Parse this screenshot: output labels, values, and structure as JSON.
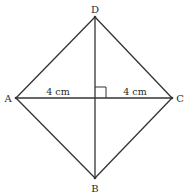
{
  "diagram": {
    "type": "rhombus-with-diagonals",
    "vertices": {
      "A": {
        "label": "A",
        "x": 16,
        "y": 98
      },
      "B": {
        "label": "B",
        "x": 95,
        "y": 178
      },
      "C": {
        "label": "C",
        "x": 172,
        "y": 98
      },
      "D": {
        "label": "D",
        "x": 95,
        "y": 17
      }
    },
    "measurements": {
      "left_half_diagonal": "4 cm",
      "right_half_diagonal": "4 cm"
    },
    "right_angle_marker": true,
    "colors": {
      "stroke": "#333333",
      "background": "#ffffff"
    }
  }
}
